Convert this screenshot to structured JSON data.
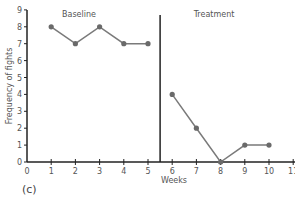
{
  "chart_data": {
    "type": "line",
    "title": "",
    "panel_label": "(c)",
    "xlabel": "Weeks",
    "ylabel": "Frequency of fights",
    "xlim": [
      0,
      11
    ],
    "ylim": [
      0,
      9
    ],
    "x_ticks": [
      0,
      1,
      2,
      3,
      4,
      5,
      6,
      7,
      8,
      9,
      10,
      11
    ],
    "y_ticks": [
      0,
      1,
      2,
      3,
      4,
      5,
      6,
      7,
      8,
      9
    ],
    "grid": false,
    "phase_change_x": 5.5,
    "phases": [
      {
        "label": "Baseline"
      },
      {
        "label": "Treatment"
      }
    ],
    "series": [
      {
        "name": "Baseline",
        "x": [
          1,
          2,
          3,
          4,
          5
        ],
        "values": [
          8,
          7,
          8,
          7,
          7
        ]
      },
      {
        "name": "Treatment",
        "x": [
          6,
          7,
          8,
          9,
          10
        ],
        "values": [
          4,
          2,
          0,
          1,
          1
        ]
      }
    ],
    "colors": {
      "line": "#7a7a7a",
      "marker": "#6a6a6a",
      "axis": "#222222",
      "text": "#555555"
    }
  }
}
